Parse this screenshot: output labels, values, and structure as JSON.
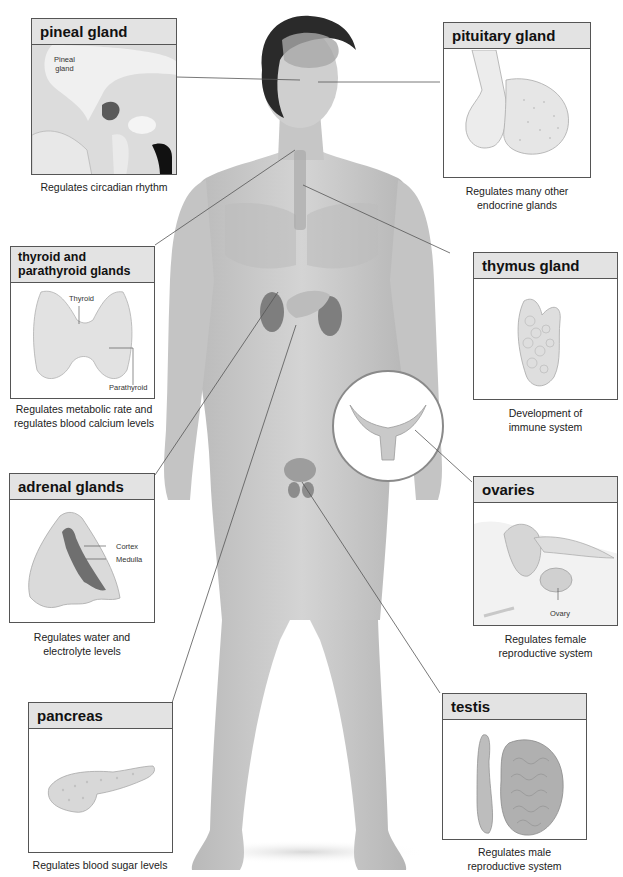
{
  "diagram": {
    "figure": "human-body-illustration",
    "inset_circle": "female-reproductive-organs-inset"
  },
  "glands": [
    {
      "id": "pineal",
      "title": "pineal gland",
      "caption": "Regulates circadian rhythm",
      "sublabels": [
        "Pineal gland"
      ]
    },
    {
      "id": "pituitary",
      "title": "pituitary gland",
      "caption": "Regulates many other endocrine glands",
      "caption_lines": [
        "Regulates many other",
        "endocrine glands"
      ],
      "sublabels": []
    },
    {
      "id": "thyroid",
      "title": "thyroid  and parathyroid glands",
      "title_lines": [
        "thyroid  and",
        "parathyroid glands"
      ],
      "caption": "Regulates metabolic rate and regulates blood calcium levels",
      "caption_lines": [
        "Regulates metabolic rate and",
        "regulates blood calcium levels"
      ],
      "sublabels": [
        "Thyroid",
        "Parathyroid"
      ]
    },
    {
      "id": "thymus",
      "title": "thymus gland",
      "caption": "Development of immune system",
      "caption_lines": [
        "Development of",
        "immune system"
      ],
      "sublabels": []
    },
    {
      "id": "adrenal",
      "title": "adrenal glands",
      "caption": "Regulates water and electrolyte levels",
      "caption_lines": [
        "Regulates water and",
        "electrolyte levels"
      ],
      "sublabels": [
        "Cortex",
        "Medulla"
      ]
    },
    {
      "id": "ovaries",
      "title": "ovaries",
      "caption": "Regulates female reproductive system",
      "caption_lines": [
        "Regulates female",
        "reproductive system"
      ],
      "sublabels": [
        "Ovary"
      ]
    },
    {
      "id": "pancreas",
      "title": "pancreas",
      "caption": "Regulates blood sugar levels",
      "sublabels": []
    },
    {
      "id": "testis",
      "title": "testis",
      "caption": "Regulates male reproductive system",
      "caption_lines": [
        "Regulates male",
        "reproductive system"
      ],
      "sublabels": []
    }
  ],
  "pineal_sublabel_lines": [
    "Pineal",
    "gland"
  ],
  "colors": {
    "header_bg": "#e3e3e3",
    "border": "#555555",
    "skin": "#c9c9c9",
    "hair": "#2a2a2a",
    "organ": "#8a8a8a"
  }
}
